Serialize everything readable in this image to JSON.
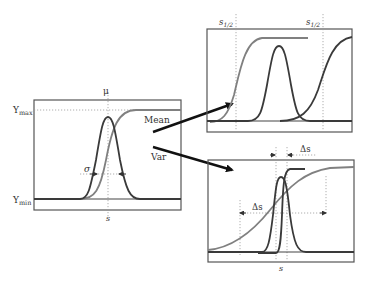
{
  "left_panel": {
    "y_max_label": "Y",
    "y_max_sub": "max",
    "y_min_label": "Y",
    "y_min_sub": "min",
    "mu_label": "μ",
    "sigma_label": "σ",
    "s_label": "s"
  },
  "arrows": {
    "mean_label": "Mean",
    "var_label": "Var"
  },
  "top_right_panel": {
    "s_half_left": "s",
    "s_half_left_sub": "1/2",
    "s_half_right": "s",
    "s_half_right_sub": "1/2"
  },
  "bottom_right_panel": {
    "delta_s_top": "Δs",
    "delta_s_left": "Δs",
    "s_label": "s"
  },
  "colors": {
    "dark_curve": "#3a3a3a",
    "grey_curve": "#808080",
    "arrow": "#111111"
  }
}
